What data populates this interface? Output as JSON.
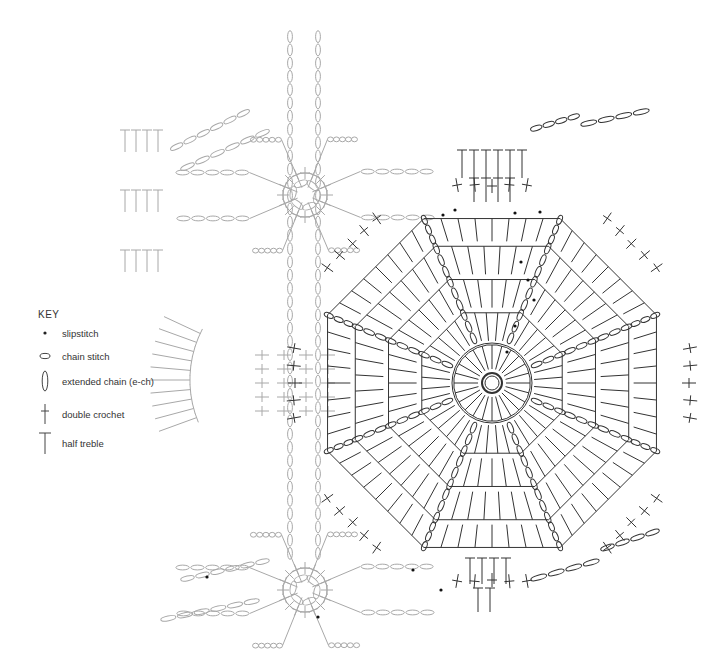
{
  "key": {
    "title": "KEY",
    "items": [
      {
        "symbol": "slipstitch",
        "label": "slipstitch",
        "y": 333
      },
      {
        "symbol": "chain",
        "label": "chain stitch",
        "y": 356
      },
      {
        "symbol": "extended-chain",
        "label": "extended chain (e-ch)",
        "y": 383
      },
      {
        "symbol": "double-crochet",
        "label": "double crochet",
        "y": 413
      },
      {
        "symbol": "half-treble",
        "label": "half treble",
        "y": 441
      }
    ]
  },
  "colors": {
    "main_motif": "#333333",
    "faded_motif": "#a8a8a8",
    "slipstitch": "#111111",
    "text": "#333333"
  },
  "motifs": {
    "main": {
      "cx": 492,
      "cy": 383,
      "center_ring_r": 10,
      "rounds": 5,
      "round_radii": [
        40,
        78,
        115,
        152,
        180
      ],
      "sides": 8
    },
    "star_top": {
      "cx": 305,
      "cy": 195,
      "ring_r": 22,
      "spokes": 8
    },
    "star_bottom": {
      "cx": 305,
      "cy": 590,
      "ring_r": 22,
      "spokes": 8
    }
  }
}
